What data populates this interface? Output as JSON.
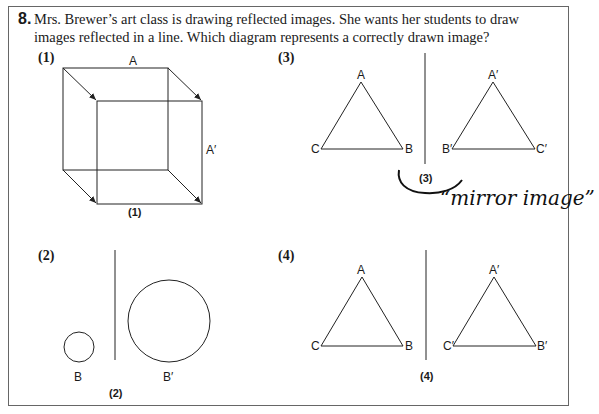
{
  "question": {
    "number": "8.",
    "text": "Mrs. Brewer’s art class is drawing reflected images. She wants her students to draw images reflected in a line. Which diagram represents a correctly drawn image?"
  },
  "options": [
    {
      "id": "(1)",
      "caption": "(1)",
      "labels": {
        "top": "A",
        "right": "A′"
      }
    },
    {
      "id": "(2)",
      "caption": "(2)",
      "labels": {
        "small": "B",
        "large": "B′"
      }
    },
    {
      "id": "(3)",
      "caption": "(3)",
      "labels": {
        "A": "A",
        "B": "B",
        "C": "C",
        "A2": "A′",
        "B2": "B′",
        "C2": "C′"
      }
    },
    {
      "id": "(4)",
      "caption": "(4)",
      "labels": {
        "A": "A",
        "B": "B",
        "C": "C",
        "A2": "A′",
        "B2": "C′",
        "C2": "B′"
      }
    }
  ],
  "annotation": {
    "handwritten": "“mirror image”"
  }
}
